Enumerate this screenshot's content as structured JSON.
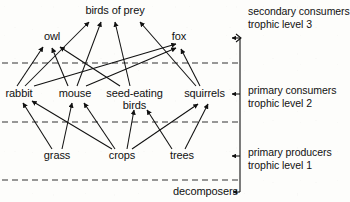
{
  "diagram": {
    "type": "food-web",
    "line_color": "#111111",
    "divider_color": "#333333",
    "nodes": [
      {
        "id": "birds-of-prey",
        "label": "birds of prey",
        "label2": "",
        "x": 115,
        "y": 12,
        "level": 3
      },
      {
        "id": "owl",
        "label": "owl",
        "label2": "",
        "x": 52,
        "y": 37,
        "level": 3
      },
      {
        "id": "fox",
        "label": "fox",
        "label2": "",
        "x": 179,
        "y": 37,
        "level": 3
      },
      {
        "id": "rabbit",
        "label": "rabbit",
        "label2": "",
        "x": 19,
        "y": 94,
        "level": 2
      },
      {
        "id": "mouse",
        "label": "mouse",
        "label2": "",
        "x": 75,
        "y": 94,
        "level": 2
      },
      {
        "id": "seed-eating-birds",
        "label": "seed-eating",
        "label2": "birds",
        "x": 134,
        "y": 94,
        "level": 2
      },
      {
        "id": "squirrels",
        "label": "squirrels",
        "label2": "",
        "x": 204,
        "y": 94,
        "level": 2
      },
      {
        "id": "grass",
        "label": "grass",
        "label2": "",
        "x": 57,
        "y": 156,
        "level": 1
      },
      {
        "id": "crops",
        "label": "crops",
        "label2": "",
        "x": 122,
        "y": 156,
        "level": 1
      },
      {
        "id": "trees",
        "label": "trees",
        "label2": "",
        "x": 182,
        "y": 156,
        "level": 1
      },
      {
        "id": "decomposers",
        "label": "decomposers",
        "label2": "",
        "x": 205,
        "y": 192,
        "level": 0
      }
    ],
    "edges": [
      {
        "from": "grass",
        "to": "rabbit"
      },
      {
        "from": "grass",
        "to": "mouse"
      },
      {
        "from": "crops",
        "to": "rabbit"
      },
      {
        "from": "crops",
        "to": "mouse"
      },
      {
        "from": "crops",
        "to": "seed-eating-birds"
      },
      {
        "from": "crops",
        "to": "squirrels"
      },
      {
        "from": "trees",
        "to": "squirrels"
      },
      {
        "from": "trees",
        "to": "seed-eating-birds"
      },
      {
        "from": "rabbit",
        "to": "owl"
      },
      {
        "from": "rabbit",
        "to": "birds-of-prey"
      },
      {
        "from": "rabbit",
        "to": "fox"
      },
      {
        "from": "mouse",
        "to": "owl"
      },
      {
        "from": "mouse",
        "to": "birds-of-prey"
      },
      {
        "from": "mouse",
        "to": "fox"
      },
      {
        "from": "seed-eating-birds",
        "to": "owl"
      },
      {
        "from": "seed-eating-birds",
        "to": "birds-of-prey"
      },
      {
        "from": "squirrels",
        "to": "birds-of-prey"
      },
      {
        "from": "squirrels",
        "to": "fox"
      }
    ],
    "dividers": [
      {
        "id": "divider-level3-level2",
        "y": 63
      },
      {
        "id": "divider-level2-level1",
        "y": 122
      },
      {
        "id": "divider-level1-decomposers",
        "y": 180
      }
    ]
  },
  "levels": [
    {
      "id": "level-3",
      "line1": "secondary consumers",
      "line2": "trophic level 3",
      "text_x": 248,
      "text_y": 6,
      "bracket_tip_y": 38
    },
    {
      "id": "level-2",
      "line1": "primary consumers",
      "line2": "trophic level 2",
      "text_x": 248,
      "text_y": 85,
      "bracket_tip_y": 94
    },
    {
      "id": "level-1",
      "line1": "primary producers",
      "line2": "trophic level 1",
      "text_x": 248,
      "text_y": 147,
      "bracket_tip_y": 156
    }
  ],
  "bracket": {
    "x": 240,
    "top_y": 38,
    "bottom_y": 192,
    "decomposer_arrow_y": 192,
    "decomposer_arrow_x_end": 234
  }
}
